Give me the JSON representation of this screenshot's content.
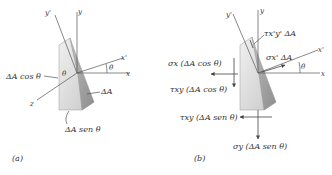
{
  "figure_a": {
    "caption": "(a)",
    "axes": {
      "x": "x",
      "y": "y",
      "z": "z",
      "x_prime": "x'",
      "y_prime": "y'"
    },
    "angle_label": "θ",
    "labels": {
      "face_left": "ΔA cos θ",
      "face_incline": "ΔA",
      "face_bottom": "ΔA sen θ"
    }
  },
  "figure_b": {
    "caption": "(b)",
    "axes": {
      "x": "x",
      "y": "y",
      "x_prime": "x'",
      "y_prime": "y'"
    },
    "angle_label": "θ",
    "forces": {
      "tau_xpyp": "τx'y' ΔA",
      "sigma_xp": "σx' ΔA",
      "sigma_x": "σx (ΔA cos θ)",
      "tau_xy_left": "τxy (ΔA cos θ)",
      "tau_xy_bottom": "τxy (ΔA sen θ)",
      "sigma_y": "σy (ΔA sen θ)"
    }
  },
  "colors": {
    "block_light": "#e6e6e6",
    "block_mid": "#c8c8c8",
    "block_dark": "#9a9a9a",
    "lines": "#555555"
  }
}
